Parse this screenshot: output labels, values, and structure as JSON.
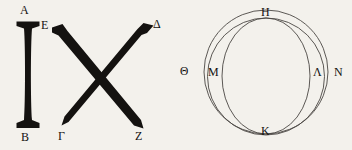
{
  "figure": {
    "background_color": "#f3f1ec",
    "ink_color": "#141210",
    "thin_line_color": "#4a4643",
    "left_diagram": {
      "name": "column-and-cross",
      "labels": {
        "a": "A",
        "b": "B",
        "e": "E",
        "gamma": "Γ",
        "delta": "Δ",
        "z": "Z"
      }
    },
    "right_diagram": {
      "name": "three-circles",
      "labels": {
        "theta": "Θ",
        "m": "M",
        "h": "H",
        "lambda": "Λ",
        "n": "N",
        "k": "K"
      }
    }
  }
}
